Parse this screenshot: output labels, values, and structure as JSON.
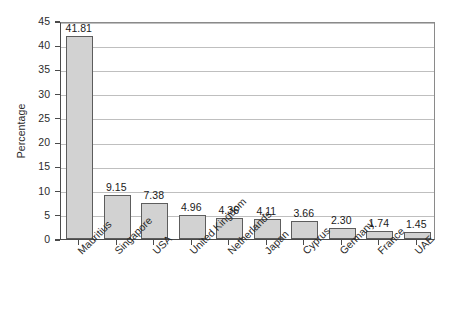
{
  "chart_data": {
    "type": "bar",
    "title": "",
    "subtitle": "",
    "xlabel": "",
    "ylabel": "Percentage",
    "ylim": [
      0,
      45
    ],
    "ytick_step": 5,
    "yticks": [
      "0",
      "5",
      "10",
      "15",
      "20",
      "25",
      "30",
      "35",
      "40",
      "45"
    ],
    "grid": "horizontal",
    "legend": "none",
    "categories": [
      "Mauritius",
      "Singapore",
      "USA",
      "United Kingdom",
      "Netherlands",
      "Japan",
      "Cyprus",
      "Germany",
      "France",
      "UAE"
    ],
    "values": [
      41.81,
      9.15,
      7.38,
      4.96,
      4.36,
      4.11,
      3.66,
      2.3,
      1.74,
      1.45
    ],
    "value_labels": [
      "41.81",
      "9.15",
      "7.38",
      "4.96",
      "4.36",
      "4.11",
      "3.66",
      "2.30",
      "1.74",
      "1.45"
    ],
    "bar_fill_color": "#d2d2d2",
    "bar_border_color": "#5d5d5d",
    "gridline_color": "#bfbfbf",
    "axis_color": "#4a4a4a",
    "background_color": "#ffffff",
    "x_label_rotation_degrees": -45
  }
}
